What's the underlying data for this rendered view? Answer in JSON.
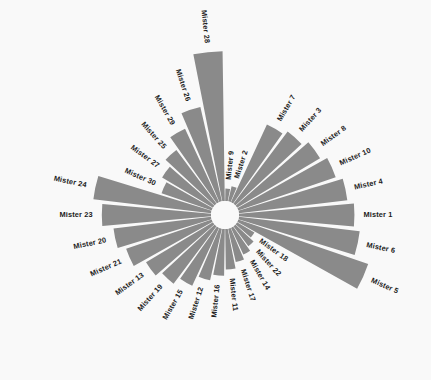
{
  "chart": {
    "title": "",
    "subtitle": "",
    "type_label": "circular-bar-chart",
    "background_color": "#f9f9f9",
    "bar_color": "#8a8a8a",
    "label_color": "#1c1c1c",
    "center_hole_radius_px": 14,
    "center_x_px": 225,
    "center_y_px": 215
  },
  "chart_data": {
    "type": "bar",
    "subtype": "circular-polar-bar",
    "title": "",
    "xlabel": "",
    "ylabel": "",
    "grid": false,
    "legend": "none",
    "start_angle_deg": 6,
    "end_angle_deg": 354,
    "direction": "clockwise",
    "inner_radius": 14,
    "max_radius": 170,
    "ylim": [
      0,
      100
    ],
    "categories": [
      "Mister 9",
      "Mister 2",
      "Mister 7",
      "Mister 3",
      "Mister 8",
      "Mister 10",
      "Mister 4",
      "Mister 1",
      "Mister 6",
      "Mister 5",
      "Mister 18",
      "Mister 22",
      "Mister 14",
      "Mister 17",
      "Mister 11",
      "Mister 16",
      "Mister 12",
      "Mister 15",
      "Mister 19",
      "Mister 13",
      "Mister 21",
      "Mister 20",
      "Mister 23",
      "Mister 24",
      "Mister 30",
      "Mister 27",
      "Mister 25",
      "Mister 29",
      "Mister 26",
      "Mister 28"
    ],
    "values": [
      8,
      10,
      55,
      58,
      62,
      66,
      70,
      74,
      78,
      88,
      13,
      16,
      19,
      22,
      26,
      30,
      34,
      41,
      46,
      50,
      58,
      63,
      70,
      76,
      34,
      38,
      43,
      52,
      62,
      96
    ],
    "angles_deg": [
      6,
      18,
      30,
      42,
      54,
      66,
      78,
      90,
      102,
      114,
      126,
      138,
      150,
      162,
      174,
      186,
      198,
      210,
      222,
      234,
      246,
      258,
      270,
      282,
      294,
      306,
      318,
      330,
      342,
      354
    ],
    "bars": [
      {
        "label": "Mister 9",
        "value": 8,
        "angle_deg": 6
      },
      {
        "label": "Mister 2",
        "value": 10,
        "angle_deg": 18
      },
      {
        "label": "Mister 7",
        "value": 55,
        "angle_deg": 30
      },
      {
        "label": "Mister 3",
        "value": 58,
        "angle_deg": 42
      },
      {
        "label": "Mister 8",
        "value": 62,
        "angle_deg": 54
      },
      {
        "label": "Mister 10",
        "value": 66,
        "angle_deg": 66
      },
      {
        "label": "Mister 4",
        "value": 70,
        "angle_deg": 78
      },
      {
        "label": "Mister 1",
        "value": 74,
        "angle_deg": 90
      },
      {
        "label": "Mister 6",
        "value": 78,
        "angle_deg": 102
      },
      {
        "label": "Mister 5",
        "value": 88,
        "angle_deg": 114
      },
      {
        "label": "Mister 18",
        "value": 13,
        "angle_deg": 126
      },
      {
        "label": "Mister 22",
        "value": 16,
        "angle_deg": 138
      },
      {
        "label": "Mister 14",
        "value": 19,
        "angle_deg": 150
      },
      {
        "label": "Mister 17",
        "value": 22,
        "angle_deg": 162
      },
      {
        "label": "Mister 11",
        "value": 26,
        "angle_deg": 174
      },
      {
        "label": "Mister 16",
        "value": 30,
        "angle_deg": 186
      },
      {
        "label": "Mister 12",
        "value": 34,
        "angle_deg": 198
      },
      {
        "label": "Mister 15",
        "value": 41,
        "angle_deg": 210
      },
      {
        "label": "Mister 19",
        "value": 46,
        "angle_deg": 222
      },
      {
        "label": "Mister 13",
        "value": 50,
        "angle_deg": 234
      },
      {
        "label": "Mister 21",
        "value": 58,
        "angle_deg": 246
      },
      {
        "label": "Mister 20",
        "value": 63,
        "angle_deg": 258
      },
      {
        "label": "Mister 23",
        "value": 70,
        "angle_deg": 270
      },
      {
        "label": "Mister 24",
        "value": 76,
        "angle_deg": 282
      },
      {
        "label": "Mister 30",
        "value": 34,
        "angle_deg": 294
      },
      {
        "label": "Mister 27",
        "value": 38,
        "angle_deg": 306
      },
      {
        "label": "Mister 25",
        "value": 43,
        "angle_deg": 318
      },
      {
        "label": "Mister 29",
        "value": 52,
        "angle_deg": 330
      },
      {
        "label": "Mister 26",
        "value": 62,
        "angle_deg": 342
      },
      {
        "label": "Mister 28",
        "value": 96,
        "angle_deg": 354
      }
    ]
  }
}
